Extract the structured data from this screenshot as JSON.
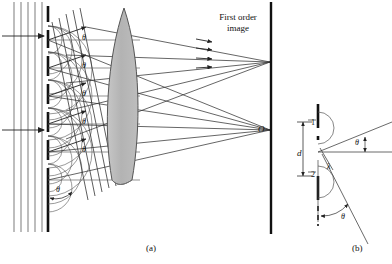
{
  "figure": {
    "title_text": "Diffraction grating with lens forming first order image",
    "panels": [
      {
        "id": "a",
        "caption": "(a)"
      },
      {
        "id": "b",
        "caption": "(b)"
      }
    ]
  },
  "panel_a": {
    "caption": "(a)",
    "first_order_label_line1": "First  order",
    "first_order_label_line2": "image",
    "origin_label": "O",
    "angle_labels": [
      "θ",
      "θ",
      "θ",
      "θ",
      "θ"
    ],
    "bottom_angle_label": "θ",
    "elements": {
      "incident_wavefronts": "plane-wavefront-lines",
      "grating": "grating-slits",
      "lens": "converging-lens",
      "screen": "screen-line"
    }
  },
  "panel_b": {
    "caption": "(b)",
    "slit_label_1": "1",
    "slit_label_2": "2",
    "separation_label": "d",
    "path_difference_label": "λ",
    "angle_label_upper": "θ",
    "angle_label_lower": "θ"
  },
  "colors": {
    "ink": "#111111",
    "lens_fill": "#b9b9b9",
    "lens_stroke": "#555555",
    "ray": "#333333",
    "background": "#ffffff"
  }
}
